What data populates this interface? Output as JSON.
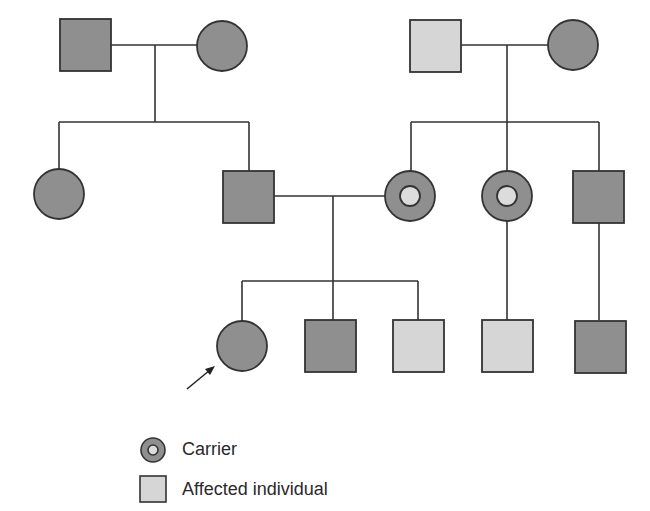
{
  "colors": {
    "unaffected_fill": "#8f8f8f",
    "affected_fill": "#d6d6d6",
    "carrier_inner_fill": "#dcdcdc",
    "stroke": "#333333",
    "background": "#ffffff"
  },
  "pedigree": {
    "generations": [
      {
        "label": "I",
        "individuals": [
          {
            "id": "I-1",
            "sex": "male",
            "status": "unaffected"
          },
          {
            "id": "I-2",
            "sex": "female",
            "status": "unaffected"
          },
          {
            "id": "I-3",
            "sex": "male",
            "status": "affected"
          },
          {
            "id": "I-4",
            "sex": "female",
            "status": "unaffected"
          }
        ]
      },
      {
        "label": "II",
        "individuals": [
          {
            "id": "II-1",
            "sex": "female",
            "status": "unaffected"
          },
          {
            "id": "II-2",
            "sex": "male",
            "status": "unaffected"
          },
          {
            "id": "II-3",
            "sex": "female",
            "status": "carrier"
          },
          {
            "id": "II-4",
            "sex": "female",
            "status": "carrier"
          },
          {
            "id": "II-5",
            "sex": "male",
            "status": "unaffected"
          }
        ]
      },
      {
        "label": "III",
        "individuals": [
          {
            "id": "III-1",
            "sex": "female",
            "status": "unaffected",
            "proband": true
          },
          {
            "id": "III-2",
            "sex": "male",
            "status": "unaffected"
          },
          {
            "id": "III-3",
            "sex": "male",
            "status": "affected"
          },
          {
            "id": "III-4",
            "sex": "male",
            "status": "affected"
          },
          {
            "id": "III-5",
            "sex": "male",
            "status": "unaffected"
          }
        ]
      }
    ]
  },
  "legend": {
    "items": [
      {
        "symbol": "carrier-circle",
        "label": "Carrier"
      },
      {
        "symbol": "affected-square",
        "label": "Affected individual"
      }
    ]
  }
}
